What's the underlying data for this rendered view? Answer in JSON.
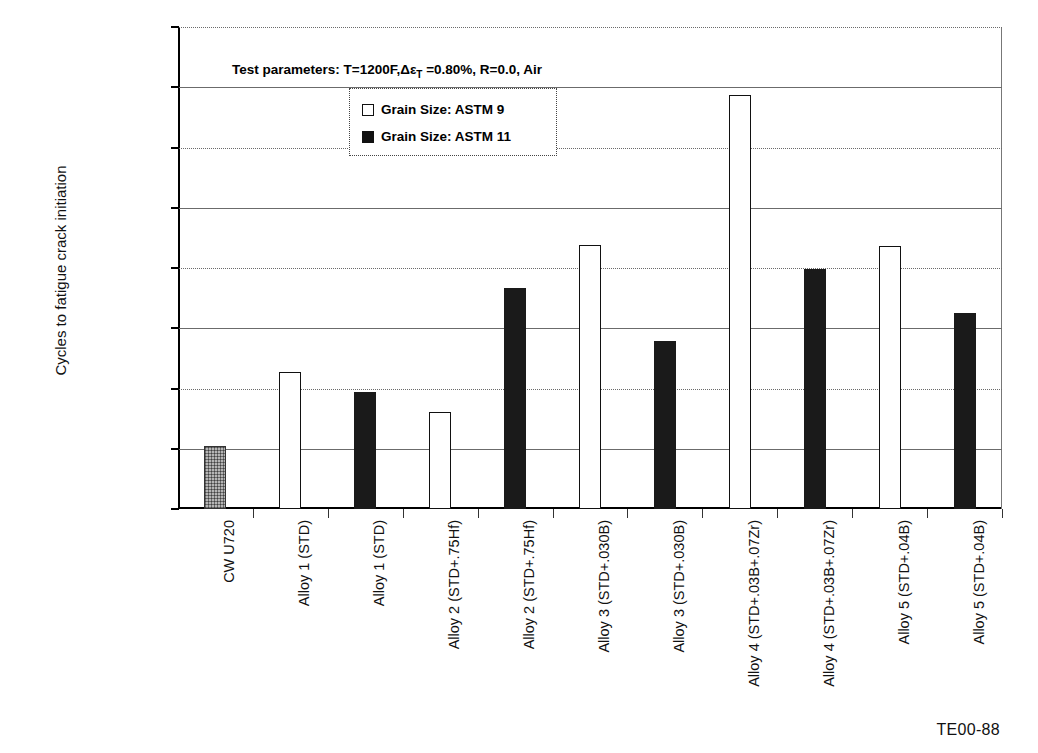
{
  "chart_data": {
    "type": "bar",
    "title": "",
    "subtitle": "",
    "xlabel": "",
    "ylabel": "Cycles to fatigue crack initiation",
    "ylim": [
      0,
      80000
    ],
    "ytick_values": [
      80000,
      70000,
      60000,
      50000,
      40000,
      30000,
      20000,
      10000,
      0
    ],
    "ytick_labels": [
      "8.00E+04",
      "7.00E+04",
      "6.00E+04",
      "5.00E+04",
      "4.00E+04",
      "3.00E+04",
      "2.00E+04",
      "1.00E+04",
      "0.00E+00"
    ],
    "grid": true,
    "legend_position": "inside-top-center",
    "annotation": "Test parameters: T=1200F,ΔεT =0.80%, R=0.0, Air",
    "annotation_parts": {
      "prefix": "Test parameters: T=1200F,",
      "delta": "Δε",
      "subscript": "T",
      "suffix": " =0.80%, R=0.0, Air"
    },
    "legend": [
      {
        "label": "Grain Size: ASTM 9",
        "style": "open"
      },
      {
        "label": "Grain Size: ASTM 11",
        "style": "filled"
      }
    ],
    "categories": [
      "CW U720",
      "Alloy 1 (STD)",
      "Alloy 1 (STD)",
      "Alloy 2 (STD+.75Hf)",
      "Alloy 2 (STD+.75Hf)",
      "Alloy 3 (STD+.030B)",
      "Alloy 3 (STD+.030B)",
      "Alloy 4 (STD+.03B+.07Zr)",
      "Alloy 4 (STD+.03B+.07Zr)",
      "Alloy 5 (STD+.04B)",
      "Alloy 5 (STD+.04B)"
    ],
    "values": [
      10500,
      22800,
      19400,
      16100,
      36700,
      43800,
      27900,
      68700,
      39900,
      43700,
      32500
    ],
    "styles": [
      "hatched",
      "open",
      "filled",
      "open",
      "filled",
      "open",
      "filled",
      "open",
      "filled",
      "open",
      "filled"
    ],
    "colors": {
      "open": "#ffffff",
      "filled": "#1a1a1a",
      "hatched": "#b5b5b5",
      "axis": "#000000",
      "grid": "#6b6b6b"
    }
  },
  "footer": {
    "code": "TE00-88"
  }
}
